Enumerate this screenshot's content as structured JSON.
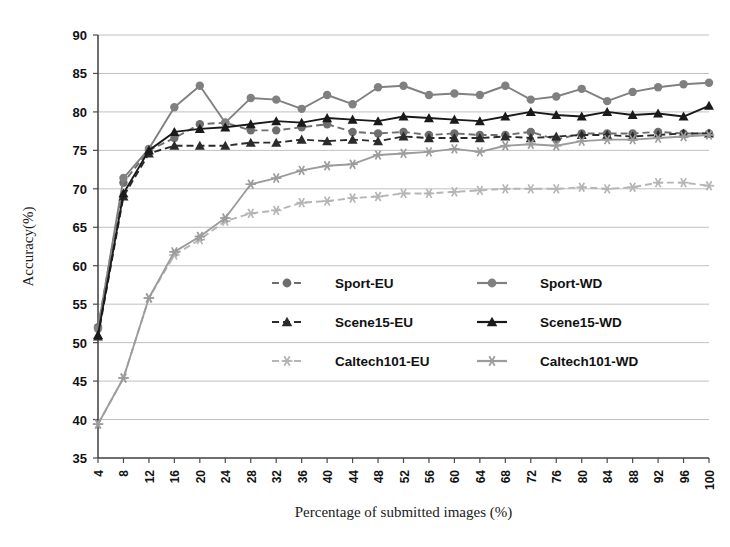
{
  "chart_data": {
    "type": "line",
    "title": "",
    "xlabel": "Percentage of submitted images (%)",
    "ylabel": "Accuracy(%)",
    "xlim": [
      4,
      100
    ],
    "ylim": [
      35,
      90
    ],
    "ytick_step": 5,
    "xtick_step": 4,
    "grid": true,
    "legend_position": "center",
    "x": [
      4,
      8,
      12,
      16,
      20,
      24,
      28,
      32,
      36,
      40,
      44,
      48,
      52,
      56,
      60,
      64,
      68,
      72,
      76,
      80,
      84,
      88,
      92,
      96,
      100
    ],
    "yticks": [
      35,
      40,
      45,
      50,
      55,
      60,
      65,
      70,
      75,
      80,
      85,
      90
    ],
    "xticks": [
      4,
      8,
      12,
      16,
      20,
      24,
      28,
      32,
      36,
      40,
      44,
      48,
      52,
      56,
      60,
      64,
      68,
      72,
      76,
      80,
      84,
      88,
      92,
      96,
      100
    ],
    "series": [
      {
        "name": "Sport-EU",
        "color": "#6e6e6e",
        "dash": "dashed",
        "marker": "circle",
        "values": [
          52.0,
          70.8,
          75.0,
          76.6,
          78.4,
          78.6,
          77.6,
          77.6,
          78.0,
          78.4,
          77.4,
          77.2,
          77.4,
          77.0,
          77.2,
          77.0,
          77.0,
          77.4,
          76.4,
          77.2,
          77.2,
          77.2,
          77.4,
          77.2,
          77.2
        ]
      },
      {
        "name": "Sport-WD",
        "color": "#808080",
        "dash": "solid",
        "marker": "circle",
        "values": [
          51.8,
          71.4,
          75.2,
          80.6,
          83.4,
          78.6,
          81.8,
          81.6,
          80.4,
          82.2,
          81.0,
          83.2,
          83.4,
          82.2,
          82.4,
          82.2,
          83.4,
          81.6,
          82.0,
          83.0,
          81.4,
          82.6,
          83.2,
          83.6,
          83.8
        ]
      },
      {
        "name": "Scene15-EU",
        "color": "#2b2b2b",
        "dash": "dashed",
        "marker": "triangle",
        "values": [
          50.8,
          69.0,
          74.6,
          75.6,
          75.6,
          75.6,
          76.0,
          76.0,
          76.4,
          76.2,
          76.4,
          76.2,
          76.8,
          76.6,
          76.6,
          76.6,
          76.8,
          76.6,
          76.8,
          77.0,
          77.0,
          76.8,
          77.0,
          77.2,
          77.2
        ]
      },
      {
        "name": "Scene15-WD",
        "color": "#1a1a1a",
        "dash": "solid",
        "marker": "triangle",
        "values": [
          51.0,
          69.4,
          75.0,
          77.4,
          77.8,
          78.0,
          78.4,
          78.8,
          78.6,
          79.2,
          79.0,
          78.8,
          79.4,
          79.2,
          79.0,
          78.8,
          79.4,
          80.0,
          79.6,
          79.4,
          80.0,
          79.6,
          79.8,
          79.4,
          80.8
        ]
      },
      {
        "name": "Caltech101-EU",
        "color": "#b5b5b5",
        "dash": "dashed",
        "marker": "star",
        "values": [
          39.4,
          45.4,
          55.8,
          61.4,
          63.4,
          65.8,
          66.8,
          67.2,
          68.2,
          68.4,
          68.8,
          69.0,
          69.4,
          69.4,
          69.6,
          69.8,
          70.0,
          70.0,
          70.0,
          70.2,
          70.0,
          70.2,
          70.8,
          70.8,
          70.4
        ]
      },
      {
        "name": "Caltech101-WD",
        "color": "#9c9c9c",
        "dash": "solid",
        "marker": "star",
        "values": [
          39.4,
          45.4,
          55.8,
          61.8,
          63.8,
          66.2,
          70.6,
          71.4,
          72.4,
          73.0,
          73.2,
          74.4,
          74.6,
          74.8,
          75.2,
          74.8,
          75.6,
          75.8,
          75.6,
          76.2,
          76.4,
          76.4,
          76.6,
          76.8,
          77.0
        ]
      }
    ]
  },
  "legend": {
    "entries": [
      {
        "label": "Sport-EU"
      },
      {
        "label": "Sport-WD"
      },
      {
        "label": "Scene15-EU"
      },
      {
        "label": "Scene15-WD"
      },
      {
        "label": "Caltech101-EU"
      },
      {
        "label": "Caltech101-WD"
      }
    ]
  }
}
